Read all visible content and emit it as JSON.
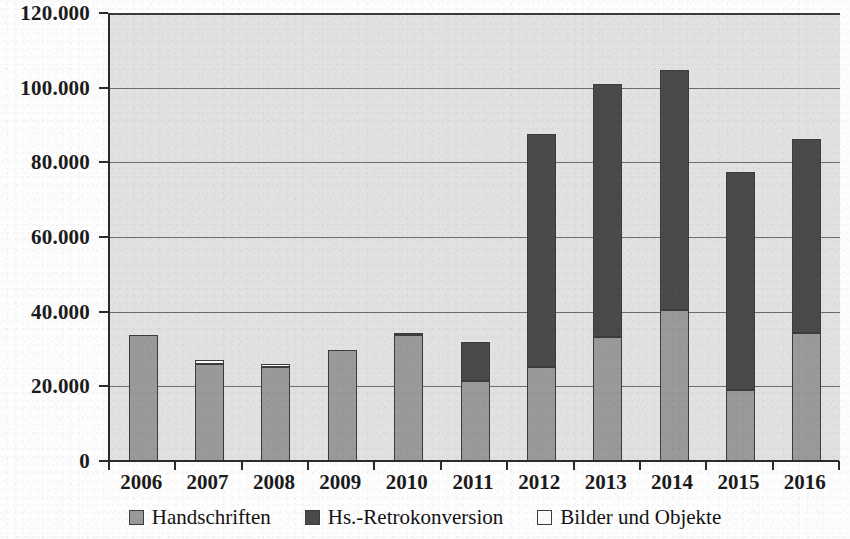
{
  "chart_data": {
    "type": "bar",
    "subtype": "stacked-column",
    "title": "",
    "xlabel": "",
    "ylabel": "",
    "categories": [
      "2006",
      "2007",
      "2008",
      "2009",
      "2010",
      "2011",
      "2012",
      "2013",
      "2014",
      "2015",
      "2016"
    ],
    "series": [
      {
        "name": "Handschriften",
        "color": "#9a9a9a",
        "values": [
          33700,
          26000,
          25200,
          29800,
          33700,
          21400,
          25200,
          33200,
          40500,
          19000,
          34300
        ]
      },
      {
        "name": "Hs.-Retrokonversion",
        "color": "#4a4a4a",
        "values": [
          0,
          0,
          0,
          0,
          0,
          10600,
          62300,
          67800,
          64300,
          58400,
          51900
        ]
      },
      {
        "name": "Bilder und Objekte",
        "color": "#fcfcfc",
        "values": [
          0,
          1000,
          900,
          0,
          300,
          0,
          0,
          0,
          0,
          0,
          0
        ]
      }
    ],
    "totals": [
      33700,
      27000,
      26100,
      29800,
      34000,
      32000,
      87500,
      101000,
      104800,
      77400,
      86200
    ],
    "ylim": [
      0,
      120000
    ],
    "y_ticks": [
      0,
      20000,
      40000,
      60000,
      80000,
      100000,
      120000
    ],
    "y_tick_labels": [
      "0",
      "20.000",
      "40.000",
      "60.000",
      "80.000",
      "100.000",
      "120.000"
    ],
    "grid": true,
    "legend_position": "bottom",
    "legend": [
      "Handschriften",
      "Hs.-Retrokonversion",
      "Bilder und Objekte"
    ],
    "plot_background": "#e2e2e2",
    "axis_color": "#2b2b2b",
    "gridline_color": "#6e6e6e"
  }
}
